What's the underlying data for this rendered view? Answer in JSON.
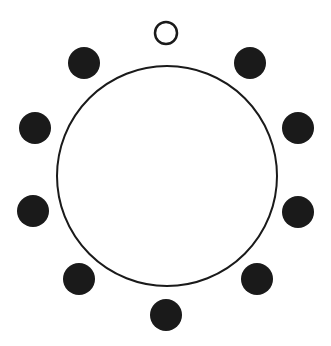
{
  "diagram": {
    "colors": {
      "stroke": "#1a1a1a",
      "fill": "#1a1a1a",
      "background": "#ffffff"
    },
    "big_circle": {
      "cx": 167,
      "cy": 176,
      "r": 110
    },
    "small_circles": [
      {
        "cx": 166,
        "cy": 33,
        "r": 11,
        "filled": false
      },
      {
        "cx": 250,
        "cy": 63,
        "r": 16,
        "filled": true
      },
      {
        "cx": 298,
        "cy": 128,
        "r": 16,
        "filled": true
      },
      {
        "cx": 298,
        "cy": 212,
        "r": 16,
        "filled": true
      },
      {
        "cx": 257,
        "cy": 279,
        "r": 16,
        "filled": true
      },
      {
        "cx": 166,
        "cy": 315,
        "r": 16,
        "filled": true
      },
      {
        "cx": 79,
        "cy": 279,
        "r": 16,
        "filled": true
      },
      {
        "cx": 33,
        "cy": 211,
        "r": 16,
        "filled": true
      },
      {
        "cx": 35,
        "cy": 128,
        "r": 16,
        "filled": true
      },
      {
        "cx": 84,
        "cy": 63,
        "r": 16,
        "filled": true
      }
    ]
  }
}
